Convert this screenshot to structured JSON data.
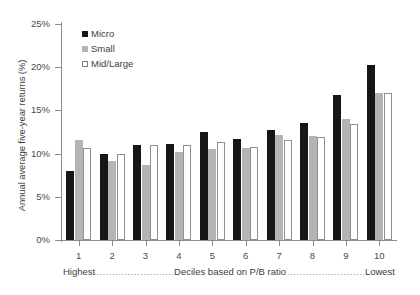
{
  "chart_data": {
    "type": "bar",
    "title": "",
    "xlabel": "Deciles based on P/B ratio",
    "ylabel": "Annual average five-year returns (%)",
    "categories": [
      "1",
      "2",
      "3",
      "4",
      "5",
      "6",
      "7",
      "8",
      "9",
      "10"
    ],
    "series": [
      {
        "name": "Micro",
        "color": "#161616",
        "values": [
          8.0,
          10.0,
          11.0,
          11.1,
          12.5,
          11.7,
          12.7,
          13.5,
          16.8,
          20.3
        ]
      },
      {
        "name": "Small",
        "color": "#b4b4b4",
        "values": [
          11.6,
          9.2,
          8.7,
          10.2,
          10.5,
          10.7,
          12.2,
          12.0,
          14.0,
          17.0
        ]
      },
      {
        "name": "Mid/Large",
        "color": "#ffffff",
        "values": [
          10.6,
          10.0,
          11.0,
          11.0,
          11.3,
          10.8,
          11.6,
          11.9,
          13.4,
          17.0
        ]
      }
    ],
    "ylim": [
      0,
      25
    ],
    "ytick_step": 5,
    "ytick_labels": [
      "0%",
      "5%",
      "10%",
      "15%",
      "20%",
      "25%"
    ],
    "grid": false,
    "legend_position": "top-left-inside"
  },
  "axis": {
    "y_title": "Annual average five-year returns (%)"
  },
  "legend": {
    "items": [
      {
        "label": "Micro",
        "swatch": "filled-black-square-icon"
      },
      {
        "label": "Small",
        "swatch": "filled-gray-square-icon"
      },
      {
        "label": "Mid/Large",
        "swatch": "outlined-white-square-icon"
      }
    ]
  },
  "caption": {
    "left": "Highest",
    "middle": "Deciles based on P/B ratio",
    "right": "Lowest",
    "dots": "........................................"
  }
}
